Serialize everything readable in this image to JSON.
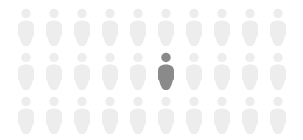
{
  "figure": {
    "type": "pictogram",
    "title": "",
    "background_color": "#ffffff",
    "columns": 10,
    "rows": 3,
    "total_figures": 30,
    "highlighted_count": 1,
    "unhighlighted_count": 29,
    "highlight_color": "#8a8a8a",
    "base_color": "#ededed",
    "icon_name": "person-icon",
    "highlighted_position": {
      "row": 2,
      "column": 6
    },
    "grid": [
      [
        {
          "state": "base"
        },
        {
          "state": "base"
        },
        {
          "state": "base"
        },
        {
          "state": "base"
        },
        {
          "state": "base"
        },
        {
          "state": "base"
        },
        {
          "state": "base"
        },
        {
          "state": "base"
        },
        {
          "state": "base"
        },
        {
          "state": "base"
        }
      ],
      [
        {
          "state": "base"
        },
        {
          "state": "base"
        },
        {
          "state": "base"
        },
        {
          "state": "base"
        },
        {
          "state": "base"
        },
        {
          "state": "highlighted"
        },
        {
          "state": "base"
        },
        {
          "state": "base"
        },
        {
          "state": "base"
        },
        {
          "state": "base"
        }
      ],
      [
        {
          "state": "base"
        },
        {
          "state": "base"
        },
        {
          "state": "base"
        },
        {
          "state": "base"
        },
        {
          "state": "base"
        },
        {
          "state": "base"
        },
        {
          "state": "base"
        },
        {
          "state": "base"
        },
        {
          "state": "base"
        },
        {
          "state": "base"
        }
      ]
    ]
  },
  "chart_data": {
    "type": "pictogram",
    "title": "",
    "xlabel": "",
    "ylabel": "",
    "categories": [
      "highlighted",
      "not highlighted"
    ],
    "values": [
      1,
      29
    ],
    "unit_value": 1,
    "unit_icon": "person",
    "grid_shape": [
      3,
      10
    ],
    "legend": [],
    "colors": [
      "#8a8a8a",
      "#ededed"
    ],
    "annotations": []
  }
}
